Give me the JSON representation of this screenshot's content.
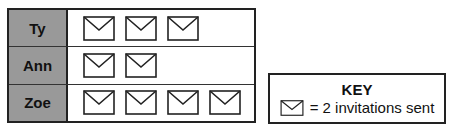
{
  "chart_data": {
    "type": "pictograph",
    "categories": [
      "Ty",
      "Ann",
      "Zoe"
    ],
    "icon_counts": [
      3,
      2,
      4
    ],
    "values": [
      6,
      4,
      8
    ],
    "icon": "envelope",
    "key": {
      "title": "KEY",
      "text": "= 2 invitations sent",
      "icon_value": 2
    }
  },
  "rows": [
    {
      "label": "Ty",
      "count": 3
    },
    {
      "label": "Ann",
      "count": 2
    },
    {
      "label": "Zoe",
      "count": 4
    }
  ],
  "key": {
    "title": "KEY",
    "text": "= 2 invitations sent"
  }
}
